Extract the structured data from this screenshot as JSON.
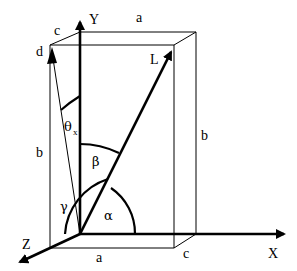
{
  "diagram": {
    "type": "3d-vector-geometry",
    "colors": {
      "stroke": "#000000",
      "background": "#ffffff"
    },
    "axes": {
      "x_label": "X",
      "y_label": "Y",
      "z_label": "Z"
    },
    "vectors": {
      "main_label": "L",
      "projection_label": "d"
    },
    "dimensions": {
      "top_width": "a",
      "top_depth": "c",
      "bottom_width": "a",
      "bottom_depth": "c",
      "left_height": "b",
      "right_height": "b"
    },
    "angles": {
      "alpha": "α",
      "beta": "β",
      "gamma": "γ",
      "theta": "θ",
      "theta_sub": "x"
    }
  }
}
